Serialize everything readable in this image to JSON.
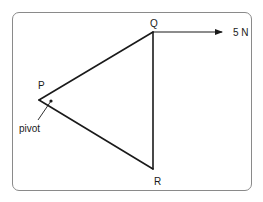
{
  "diagram": {
    "type": "force-on-triangular-lamina",
    "vertices": [
      {
        "id": "P",
        "label": "P",
        "x": 39,
        "y": 100,
        "label_x": 38,
        "label_y": 89
      },
      {
        "id": "Q",
        "label": "Q",
        "x": 153,
        "y": 32,
        "label_x": 150,
        "label_y": 27
      },
      {
        "id": "R",
        "label": "R",
        "x": 153,
        "y": 169,
        "label_x": 154,
        "label_y": 185
      }
    ],
    "edges": [
      {
        "from": "P",
        "to": "Q"
      },
      {
        "from": "Q",
        "to": "R"
      },
      {
        "from": "R",
        "to": "P"
      }
    ],
    "pivot": {
      "label": "pivot",
      "dot_x": 51,
      "dot_y": 101,
      "leader_end_x": 38,
      "leader_end_y": 120,
      "label_x": 19,
      "label_y": 132
    },
    "force": {
      "label": "5 N",
      "from": "Q",
      "start_x": 153,
      "start_y": 32,
      "end_x": 222,
      "end_y": 32,
      "label_x": 233,
      "label_y": 36,
      "direction": "right"
    },
    "colors": {
      "stroke": "#1a1a1a",
      "frame": "#8a8a8a",
      "background": "#ffffff"
    }
  }
}
